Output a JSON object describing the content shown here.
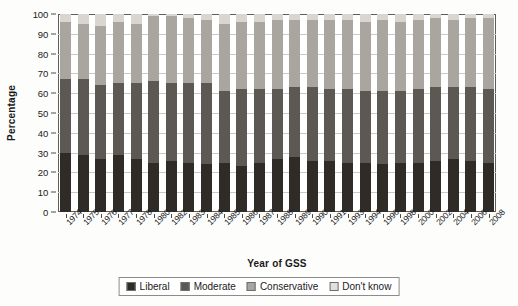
{
  "chart_data": {
    "type": "bar",
    "subtype": "stacked-bar-100",
    "title": "",
    "xlabel": "Year of GSS",
    "ylabel": "Percentage",
    "ylim": [
      0,
      100
    ],
    "ytick_step": 10,
    "yticks": [
      0,
      10,
      20,
      30,
      40,
      50,
      60,
      70,
      80,
      90,
      100
    ],
    "grid": true,
    "legend_position": "bottom",
    "legend": [
      "Liberal",
      "Moderate",
      "Conservative",
      "Don't know"
    ],
    "colors": {
      "Liberal": "#2f2b27",
      "Moderate": "#5c5854",
      "Conservative": "#a9a6a0",
      "Don't know": "#d9d6d1"
    },
    "categories": [
      "1974",
      "1975",
      "1976",
      "1977",
      "1978",
      "1980",
      "1982",
      "1983",
      "1984",
      "1985",
      "1986",
      "1987",
      "1988",
      "1989",
      "1990",
      "1991",
      "1993",
      "1994",
      "1996",
      "1998",
      "2000",
      "2002",
      "2004",
      "2006",
      "2008"
    ],
    "series": [
      {
        "name": "Liberal",
        "values": [
          30,
          29,
          27,
          29,
          27,
          25,
          26,
          25,
          24,
          25,
          23,
          25,
          27,
          28,
          26,
          26,
          25,
          25,
          24,
          25,
          25,
          26,
          27,
          26,
          25
        ]
      },
      {
        "name": "Moderate",
        "values": [
          37,
          38,
          37,
          36,
          38,
          41,
          39,
          40,
          41,
          36,
          39,
          37,
          35,
          35,
          37,
          36,
          37,
          36,
          37,
          36,
          37,
          37,
          36,
          37,
          37
        ]
      },
      {
        "name": "Conservative",
        "values": [
          29,
          28,
          30,
          31,
          30,
          33,
          34,
          33,
          32,
          34,
          34,
          34,
          35,
          34,
          34,
          35,
          35,
          35,
          36,
          35,
          35,
          35,
          34,
          35,
          36
        ]
      },
      {
        "name": "Don't know",
        "values": [
          4,
          5,
          6,
          4,
          5,
          1,
          1,
          2,
          3,
          5,
          4,
          4,
          3,
          3,
          3,
          3,
          3,
          4,
          3,
          4,
          3,
          2,
          3,
          2,
          2
        ]
      }
    ]
  }
}
